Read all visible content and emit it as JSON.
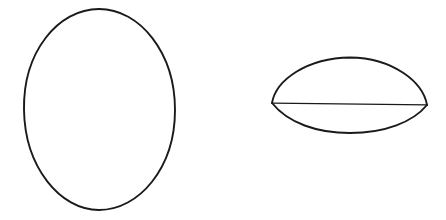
{
  "figure": {
    "background_color": "#ffffff",
    "canvas": {
      "width": 446,
      "height": 220
    },
    "stroke": {
      "color": "#1a1a1a",
      "ellipse_width": 1.9,
      "lens_arc_width": 1.9,
      "chord_width": 1.2
    },
    "shapes": [
      {
        "id": "ellipse",
        "name": "hand-drawn-ellipse",
        "kind": "ellipse",
        "description": "Tall oval outline on the left side, drawn freehand",
        "bounds": {
          "x_min": 24,
          "x_max": 175,
          "y_min": 9,
          "y_max": 210
        },
        "center": {
          "x": 99.5,
          "y": 109.5
        },
        "radii": {
          "rx": 75.5,
          "ry": 100.5
        },
        "filled": false,
        "path": "M 99 9 C 140 9 175 53 175 110 C 175 168 139 210 99 210 C 60 210 25 167 24 110 C 23 52 58 9 99 9 Z"
      },
      {
        "id": "lens",
        "name": "lens-shape-with-chord",
        "kind": "lens",
        "description": "Eye or lens shape on the right: a tall upper arc and a shallow lower arc meeting at two side vertices, divided by a horizontal chord",
        "bounds": {
          "x_min": 272,
          "x_max": 427,
          "y_min": 57,
          "y_max": 134
        },
        "vertex_left": {
          "x": 272,
          "y": 103
        },
        "vertex_right": {
          "x": 427,
          "y": 105
        },
        "upper_apex": {
          "x": 350,
          "y": 58
        },
        "lower_nadir": {
          "x": 350,
          "y": 133
        },
        "filled": false,
        "parts": [
          {
            "id": "upper-arc",
            "name": "upper-dome-arc",
            "path": "M 272 103 C 276 80 307 58 350 57.5 C 393 58 423 82 427 105"
          },
          {
            "id": "lower-arc",
            "name": "lower-shallow-arc",
            "path": "M 272 103 C 288 123 317 133 350 133 C 385 133 413 122 427 105"
          },
          {
            "id": "chord",
            "name": "horizontal-chord-line",
            "path": "M 272.5 103.2 L 427 104.8"
          }
        ]
      }
    ]
  }
}
